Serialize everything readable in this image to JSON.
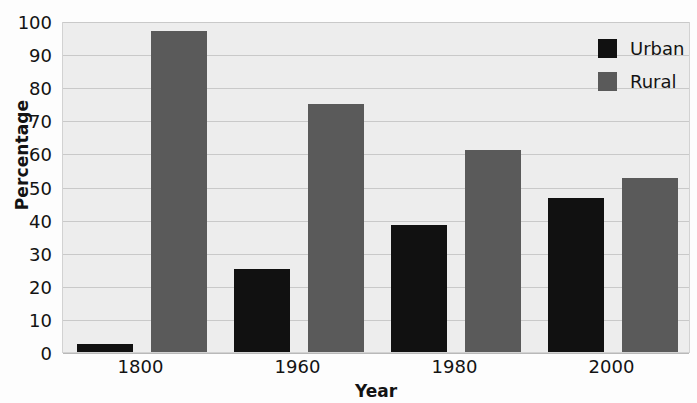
{
  "chart_data": {
    "type": "bar",
    "title": "",
    "xlabel": "Year",
    "ylabel": "Percentage",
    "categories": [
      "1800",
      "1960",
      "1980",
      "2000"
    ],
    "series": [
      {
        "name": "Urban",
        "color": "#111111",
        "values": [
          2.5,
          25,
          38.5,
          46.5
        ]
      },
      {
        "name": "Rural",
        "color": "#5a5a5a",
        "values": [
          97,
          75,
          61,
          52.5
        ]
      }
    ],
    "ylim": [
      0,
      100
    ],
    "y_ticks": [
      0,
      10,
      20,
      30,
      40,
      50,
      60,
      70,
      80,
      90,
      100
    ],
    "y_tick_labels": [
      "0",
      "10",
      "20",
      "30",
      "40",
      "50",
      "60",
      "70",
      "80",
      "90",
      "100"
    ],
    "grid": true,
    "grid_axis": "y",
    "legend_position": "top-right",
    "plot_background": "#ededed",
    "grid_color": "#c9c9c9"
  }
}
